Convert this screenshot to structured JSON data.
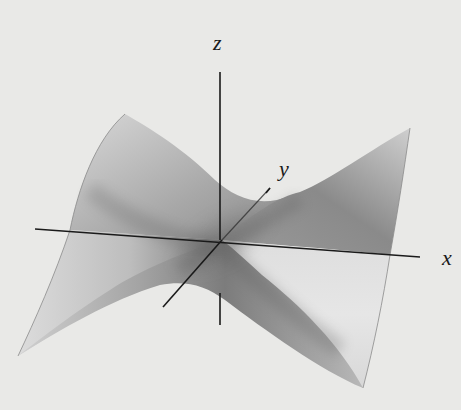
{
  "figure": {
    "type": "3d-surface",
    "surface": "saddle (hyperbolic paraboloid)",
    "axes": {
      "x_label": "x",
      "y_label": "y",
      "z_label": "z"
    },
    "colors": {
      "background": "#e9e9e7",
      "surface_light": "#e2e2e2",
      "surface_dark": "#6e6e6e",
      "axis": "#1a1a1a"
    }
  }
}
